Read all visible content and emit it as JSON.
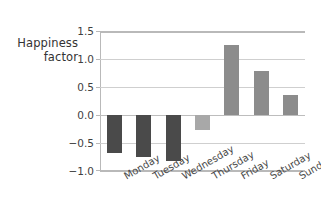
{
  "chart_data": {
    "type": "bar",
    "title": "",
    "xlabel": "",
    "ylabel": "Happiness factor",
    "ylabel_lines": [
      "Happiness",
      "factor"
    ],
    "categories": [
      "Monday",
      "Tuesday",
      "Wednesday",
      "Thursday",
      "Friday",
      "Saturday",
      "Sunday"
    ],
    "values": [
      -0.68,
      -0.75,
      -0.82,
      -0.27,
      1.25,
      0.78,
      0.35
    ],
    "ylim": [
      -1.0,
      1.5
    ],
    "yticks": [
      1.5,
      1.0,
      0.5,
      0.0,
      -0.5,
      -1.0
    ],
    "ytick_labels": [
      "1.5",
      "1.0",
      "0.5",
      "0.0",
      "−0.5",
      "−1.0"
    ],
    "grid": true,
    "legend": "none",
    "bar_colors": {
      "negative_dark": "#4a4a4a",
      "negative_light": "#a8a8a8",
      "positive": "#8c8c8c"
    },
    "bars": [
      {
        "category": "Monday",
        "value": -0.68,
        "color": "#4a4a4a"
      },
      {
        "category": "Tuesday",
        "value": -0.75,
        "color": "#4a4a4a"
      },
      {
        "category": "Wednesday",
        "value": -0.82,
        "color": "#4a4a4a"
      },
      {
        "category": "Thursday",
        "value": -0.27,
        "color": "#a8a8a8"
      },
      {
        "category": "Friday",
        "value": 1.25,
        "color": "#8c8c8c"
      },
      {
        "category": "Saturday",
        "value": 0.78,
        "color": "#8c8c8c"
      },
      {
        "category": "Sunday",
        "value": 0.35,
        "color": "#8c8c8c"
      }
    ],
    "axis_colors": {
      "frame": "#b9b9b9",
      "gridline": "#cfcfcf",
      "zero_line": "#bdbdbd",
      "text": "#3f3f3f"
    }
  }
}
